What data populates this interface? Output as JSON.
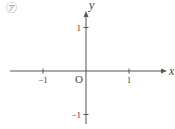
{
  "panel_marker": "㋐",
  "chart_data": {
    "type": "line",
    "title": "",
    "xlabel": "x",
    "ylabel": "y",
    "origin_label": "O",
    "xlim": [
      -1.8,
      1.8
    ],
    "ylim": [
      -1.2,
      1.4
    ],
    "xticks": [
      {
        "value": -1,
        "label": "−1"
      },
      {
        "value": 1,
        "label": "1"
      }
    ],
    "yticks": [
      {
        "value": 1,
        "label": "1"
      },
      {
        "value": -1,
        "label": "−1"
      }
    ],
    "grid": false,
    "series": [],
    "axis_color": "#555555"
  }
}
